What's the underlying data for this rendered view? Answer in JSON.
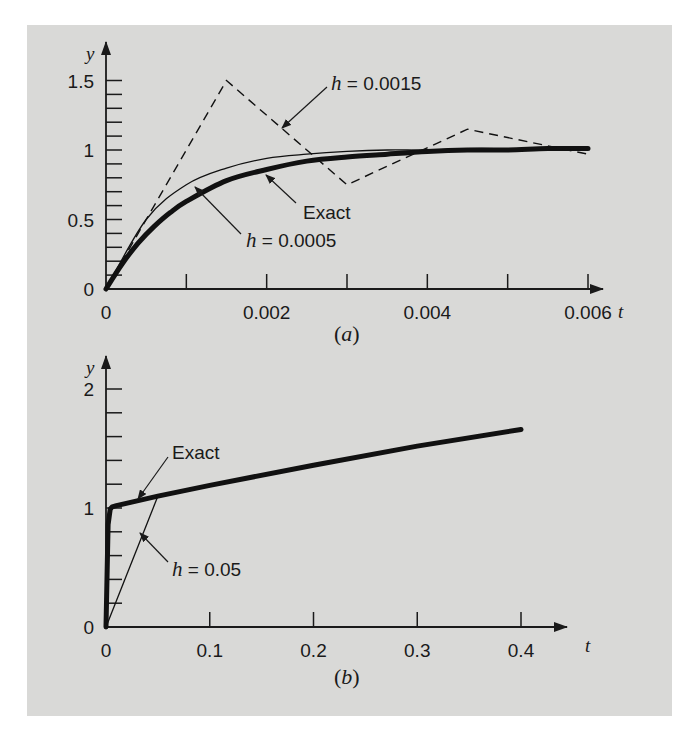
{
  "background": {
    "panel": "#d9d9d7",
    "page": "#ffffff",
    "ink": "#1a1a1a"
  },
  "chart_data": [
    {
      "type": "line",
      "caption": "(a)",
      "caption_letter": "a",
      "xlabel": "t",
      "ylabel": "y",
      "xlim": [
        0,
        0.006
      ],
      "ylim": [
        0,
        1.5
      ],
      "xticks": [
        0,
        0.001,
        0.002,
        0.003,
        0.004,
        0.005,
        0.006
      ],
      "xtick_labels": [
        "0",
        "",
        "0.002",
        "",
        "0.004",
        "",
        "0.006"
      ],
      "yticks_major": [
        0,
        0.5,
        1,
        1.5
      ],
      "ytick_labels": [
        "0",
        "0.5",
        "1",
        "1.5"
      ],
      "ytick_minor_step": 0.1,
      "grid": false,
      "series": [
        {
          "name": "Exact",
          "style": "thick",
          "x": [
            0,
            0.0002,
            0.0004,
            0.0006,
            0.0008,
            0.001,
            0.0015,
            0.002,
            0.0025,
            0.003,
            0.0035,
            0.004,
            0.0045,
            0.005,
            0.0055,
            0.006
          ],
          "y": [
            0,
            0.18,
            0.33,
            0.45,
            0.55,
            0.63,
            0.78,
            0.86,
            0.92,
            0.95,
            0.97,
            0.99,
            1.0,
            1.0,
            1.01,
            1.01
          ]
        },
        {
          "name": "h = 0.0005",
          "style": "thin",
          "x": [
            0,
            0.0005,
            0.001,
            0.0015,
            0.002,
            0.0025,
            0.003,
            0.0035,
            0.004,
            0.0045,
            0.005,
            0.0055,
            0.006
          ],
          "y": [
            0,
            0.5,
            0.75,
            0.87,
            0.94,
            0.97,
            0.99,
            1.0,
            1.0,
            1.01,
            1.01,
            1.01,
            1.01
          ]
        },
        {
          "name": "h = 0.0015",
          "style": "dashed",
          "x": [
            0,
            0.0015,
            0.003,
            0.0045,
            0.006
          ],
          "y": [
            0,
            1.5,
            0.75,
            1.15,
            0.97
          ]
        }
      ],
      "annotations": [
        {
          "text_var": "h",
          "text_rest": " = 0.0015",
          "target": "h = 0.0015"
        },
        {
          "text": "Exact",
          "target": "Exact"
        },
        {
          "text_var": "h",
          "text_rest": " = 0.0005",
          "target": "h = 0.0005"
        }
      ]
    },
    {
      "type": "line",
      "caption": "(b)",
      "caption_letter": "b",
      "xlabel": "t",
      "ylabel": "y",
      "xlim": [
        0,
        0.4
      ],
      "ylim": [
        0,
        2
      ],
      "xticks": [
        0,
        0.1,
        0.2,
        0.3,
        0.4
      ],
      "xtick_labels": [
        "0",
        "0.1",
        "0.2",
        "0.3",
        "0.4"
      ],
      "yticks_major": [
        0,
        1,
        2
      ],
      "ytick_labels": [
        "0",
        "1",
        "2"
      ],
      "ytick_minor_step": 0.2,
      "grid": false,
      "series": [
        {
          "name": "Exact",
          "style": "thick",
          "x": [
            0,
            0.002,
            0.004,
            0.006,
            0.01,
            0.05,
            0.1,
            0.2,
            0.3,
            0.4
          ],
          "y": [
            0,
            0.86,
            0.99,
            1.01,
            1.02,
            1.1,
            1.19,
            1.36,
            1.52,
            1.66
          ]
        },
        {
          "name": "h = 0.05",
          "style": "thin",
          "x": [
            0,
            0.05
          ],
          "y": [
            0,
            1.1
          ]
        }
      ],
      "annotations": [
        {
          "text": "Exact",
          "target": "Exact"
        },
        {
          "text_var": "h",
          "text_rest": " = 0.05",
          "target": "h = 0.05"
        }
      ]
    }
  ]
}
